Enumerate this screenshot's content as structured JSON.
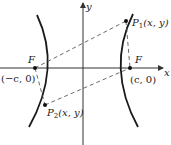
{
  "diagram": {
    "type": "hyperbola-foci",
    "axes": {
      "x_label": "x",
      "y_label": "y"
    },
    "foci": {
      "left": {
        "name": "F",
        "coords": "(−c, 0)"
      },
      "right": {
        "name": "F",
        "coords": "(c, 0)"
      }
    },
    "points": {
      "p1": {
        "name": "P",
        "sub": "1",
        "coords": "(x, y)"
      },
      "p2": {
        "name": "P",
        "sub": "2",
        "coords": "(x, y)"
      }
    },
    "colors": {
      "curve": "#1a1a1a",
      "axis": "#333333",
      "dashed": "#444444"
    }
  }
}
